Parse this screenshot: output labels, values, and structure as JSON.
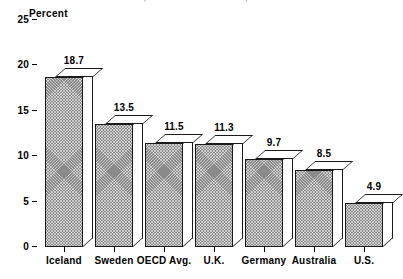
{
  "chart_data": {
    "type": "bar",
    "title": "",
    "subtitle": "",
    "xlabel": "",
    "ylabel": "Percent",
    "ylim": [
      0,
      25
    ],
    "yticks": [
      0,
      5,
      10,
      15,
      20,
      25
    ],
    "grid": false,
    "legend": null,
    "value_labels_shown": true,
    "categories": [
      "Iceland",
      "Sweden",
      "OECD Avg.",
      "U.K.",
      "Germany",
      "Australia",
      "U.S."
    ],
    "values": [
      18.7,
      13.5,
      11.5,
      11.3,
      9.7,
      8.5,
      4.9
    ],
    "value_label_text": [
      "18.7",
      "13.5",
      "11.5",
      "11.3",
      "9.7",
      "8.5",
      "4.9"
    ]
  },
  "axis": {
    "y_title": "Percent",
    "tick_labels": [
      "25",
      "20",
      "15",
      "10",
      "5",
      "0"
    ]
  },
  "title_remnant": {
    "text": "OECD, Health Data Database, 1997"
  },
  "style": {
    "bar_fill": "#8a8a8a",
    "bar_outline": "#1a1a1a",
    "bar_top_face": "#ffffff",
    "background": "#ffffff",
    "text_color": "#000000"
  }
}
